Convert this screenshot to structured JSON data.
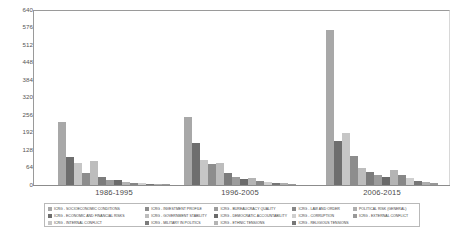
{
  "chart_data": {
    "type": "bar",
    "title": "",
    "subtitle": "",
    "xlabel": "",
    "ylabel": "",
    "ylim": [
      0,
      640
    ],
    "grid": false,
    "legend_position": "bottom",
    "categories": [
      "1986-1995",
      "1996-2005",
      "2006-2015"
    ],
    "yticks": [
      640,
      576,
      512,
      448,
      384,
      320,
      256,
      192,
      128,
      64,
      0
    ],
    "series": [
      {
        "name": "ICRG - SOCIOECONOMIC CONDITIONS",
        "color": "#a8a8a8",
        "values": [
          232,
          250,
          568
        ]
      },
      {
        "name": "ICRG - ECONOMIC AND FINANCIAL RISKS",
        "color": "#6e6e6e",
        "values": [
          104,
          155,
          160
        ]
      },
      {
        "name": "ICRG - INTERNAL CONFLICT",
        "color": "#c6c6c6",
        "values": [
          80,
          90,
          190
        ]
      },
      {
        "name": "ICRG - INVESTMENT PROFILE",
        "color": "#8d8d8d",
        "values": [
          45,
          78,
          105
        ]
      },
      {
        "name": "ICRG - GOVERNMENT STABILITY",
        "color": "#bdbdbd",
        "values": [
          88,
          80,
          62
        ]
      },
      {
        "name": "ICRG - MILITARY IN POLITICS",
        "color": "#7c7c7c",
        "values": [
          30,
          45,
          46
        ]
      },
      {
        "name": "ICRG - BUREAUCRACY QUALITY",
        "color": "#9c9c9c",
        "values": [
          20,
          28,
          35
        ]
      },
      {
        "name": "ICRG - DEMOCRATIC ACCOUNTABILITY",
        "color": "#6a6a6a",
        "values": [
          18,
          22,
          30
        ]
      },
      {
        "name": "ICRG - ETHNIC TENSIONS",
        "color": "#b4b4b4",
        "values": [
          10,
          25,
          55
        ]
      },
      {
        "name": "ICRG - LAW AND ORDER",
        "color": "#878787",
        "values": [
          8,
          14,
          38
        ]
      },
      {
        "name": "ICRG - CORRUPTION",
        "color": "#cfcfcf",
        "values": [
          6,
          10,
          24
        ]
      },
      {
        "name": "ICRG - RELIGIOUS TENSIONS",
        "color": "#767676",
        "values": [
          4,
          8,
          14
        ]
      },
      {
        "name": "POLITICAL RISK (GENERAL)",
        "color": "#aeaeae",
        "values": [
          3,
          6,
          10
        ]
      },
      {
        "name": "ICRG - EXTERNAL CONFLICT",
        "color": "#999999",
        "values": [
          2,
          4,
          6
        ]
      }
    ]
  },
  "legend": {
    "columns": [
      [
        "ICRG - SOCIOECONOMIC CONDITIONS",
        "ICRG - ECONOMIC AND FINANCIAL RISKS",
        "ICRG - INTERNAL CONFLICT"
      ],
      [
        "ICRG - INVESTMENT PROFILE",
        "ICRG - GOVERNMENT STABILITY",
        "ICRG - MILITARY IN POLITICS"
      ],
      [
        "ICRG - BUREAUCRACY QUALITY",
        "ICRG - DEMOCRATIC ACCOUNTABILITY",
        "ICRG - ETHNIC TENSIONS"
      ],
      [
        "ICRG - LAW AND ORDER",
        "ICRG - CORRUPTION",
        "ICRG - RELIGIOUS TENSIONS"
      ],
      [
        "POLITICAL RISK (GENERAL)",
        "ICRG - EXTERNAL CONFLICT"
      ]
    ]
  }
}
